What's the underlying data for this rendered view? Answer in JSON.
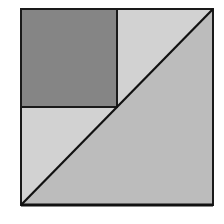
{
  "diagram": {
    "outer_square": {
      "x": 21,
      "y": 9,
      "size": 192,
      "stroke": "#1a1a1a"
    },
    "inner_square": {
      "x": 21,
      "y": 9,
      "width": 96,
      "height": 98,
      "fill": "#858585",
      "stroke": "#1a1a1a"
    },
    "regions": [
      {
        "name": "dark-square",
        "fill": "#858585"
      },
      {
        "name": "upper-right-light-triangle",
        "fill": "#d2d2d2"
      },
      {
        "name": "lower-left-light-triangle",
        "fill": "#d2d2d2"
      },
      {
        "name": "lower-right-large-triangle",
        "fill": "#bcbcbc"
      }
    ],
    "diagonal": {
      "x1": 21,
      "y1": 205,
      "x2": 213,
      "y2": 9,
      "stroke": "#111111"
    }
  }
}
